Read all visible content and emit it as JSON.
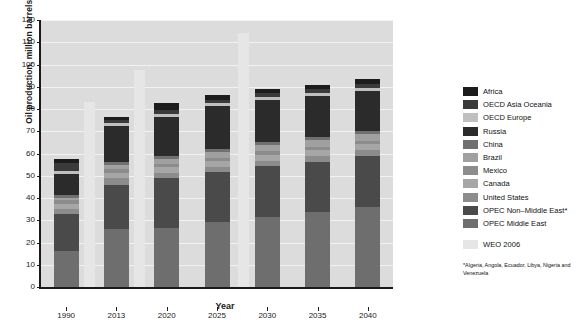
{
  "chart_data": {
    "type": "bar",
    "title": "",
    "xlabel": "Year",
    "ylabel": "Oil production, million barrels/day",
    "categories": [
      "1990",
      "2013",
      "2020",
      "2025",
      "2030",
      "2035",
      "2040"
    ],
    "ylim": [
      0,
      120
    ],
    "yticks": [
      0,
      10,
      20,
      30,
      40,
      50,
      60,
      70,
      80,
      90,
      100,
      110,
      120
    ],
    "grid": true,
    "legend_position": "right",
    "stacked": true,
    "series": [
      {
        "name": "OPEC Middle East",
        "color": "#6e6e6e",
        "values": [
          16.0,
          26.2,
          26.6,
          29.0,
          31.6,
          33.6,
          36.1
        ]
      },
      {
        "name": "OPEC Non-Middle East*",
        "color": "#4a4a4a",
        "values": [
          16.9,
          19.8,
          22.2,
          22.6,
          22.6,
          22.7,
          22.9
        ]
      },
      {
        "name": "United States",
        "color": "#8c8c8c",
        "values": [
          2.3,
          3.1,
          2.6,
          2.4,
          2.4,
          2.5,
          2.5
        ]
      },
      {
        "name": "Canada",
        "color": "#a6a6a6",
        "values": [
          2.0,
          2.2,
          2.4,
          2.6,
          2.8,
          2.8,
          2.8
        ]
      },
      {
        "name": "Mexico",
        "color": "#8c8c8c",
        "values": [
          1.9,
          1.9,
          1.7,
          1.6,
          1.6,
          1.5,
          1.5
        ]
      },
      {
        "name": "Brazil",
        "color": "#a0a0a0",
        "values": [
          1.1,
          1.6,
          2.2,
          2.5,
          2.7,
          2.8,
          2.9
        ]
      },
      {
        "name": "China",
        "color": "#707070",
        "values": [
          1.1,
          1.4,
          1.4,
          1.4,
          1.4,
          1.4,
          1.4
        ]
      },
      {
        "name": "Russia",
        "color": "#2b2b2b",
        "values": [
          9.7,
          16.2,
          17.5,
          19.1,
          18.9,
          18.5,
          18.0
        ]
      },
      {
        "name": "OECD Europe",
        "color": "#bfbfbf",
        "values": [
          1.2,
          1.3,
          1.3,
          1.3,
          1.3,
          1.3,
          1.3
        ]
      },
      {
        "name": "OECD Asia Oceania",
        "color": "#3a3a3a",
        "values": [
          3.4,
          1.5,
          1.6,
          1.6,
          1.7,
          1.7,
          1.7
        ]
      },
      {
        "name": "Africa",
        "color": "#1c1c1c",
        "values": [
          2.0,
          1.3,
          3.1,
          2.2,
          2.1,
          2.1,
          2.2
        ]
      }
    ],
    "totals": [
      57.6,
      76.5,
      82.6,
      86.3,
      89.1,
      90.9,
      93.3
    ],
    "overlay": {
      "name": "WEO 2006",
      "color": "#e6e6e6",
      "points": [
        {
          "x": "1990-right",
          "value": 83.0
        },
        {
          "x": "2013-right",
          "value": 97.5
        },
        {
          "x": "2027",
          "value": 114.0
        }
      ]
    }
  },
  "legend": {
    "items": [
      {
        "label": "Africa",
        "color": "#1c1c1c"
      },
      {
        "label": "OECD Asia Oceania",
        "color": "#3a3a3a"
      },
      {
        "label": "OECD Europe",
        "color": "#bfbfbf"
      },
      {
        "label": "Russia",
        "color": "#2b2b2b"
      },
      {
        "label": "China",
        "color": "#707070"
      },
      {
        "label": "Brazil",
        "color": "#a0a0a0"
      },
      {
        "label": "Mexico",
        "color": "#8c8c8c"
      },
      {
        "label": "Canada",
        "color": "#a6a6a6"
      },
      {
        "label": "United States",
        "color": "#8c8c8c"
      },
      {
        "label": "OPEC Non–Middle East*",
        "color": "#4a4a4a"
      },
      {
        "label": "OPEC Middle East",
        "color": "#6e6e6e"
      }
    ],
    "overlay_label": "WEO 2006",
    "overlay_color": "#e6e6e6"
  },
  "footnote": "*Algeria, Angola, Ecuador, Libya, Nigeria and Venezuela"
}
